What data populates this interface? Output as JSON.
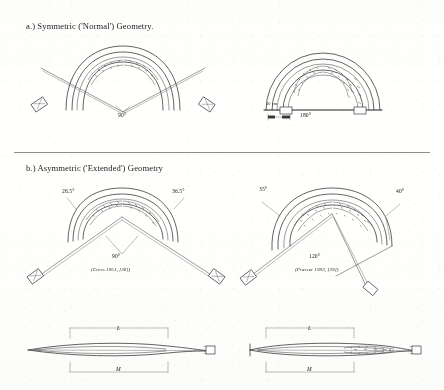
{
  "figure": {
    "sections": [
      {
        "id": "a",
        "heading": "a.)  Symmetric ('Normal') Geometry.",
        "diagrams": [
          {
            "id": "a-left",
            "angle_label": "90°",
            "scale_label": "",
            "citation": ""
          },
          {
            "id": "a-right",
            "angle_label": "180°",
            "scale_label": "10 cm",
            "citation": ""
          }
        ]
      },
      {
        "id": "b",
        "heading": "b.)  Asymmetric ('Extended') Geometry",
        "diagrams": [
          {
            "id": "b-left",
            "angle_label": "90°",
            "limb_angle_left": "26.5°",
            "limb_angle_right": "36.5°",
            "citation": "(Cross 1951, [28])"
          },
          {
            "id": "b-right",
            "angle_label": "120°",
            "limb_angle_left": "35°",
            "limb_angle_right": "40°",
            "citation": "(Prasser 1993, [29])"
          }
        ]
      }
    ],
    "profiles": [
      {
        "id": "profile-left",
        "upper_dimension": "L",
        "lower_dimension": "M"
      },
      {
        "id": "profile-right",
        "upper_dimension": "L",
        "lower_dimension": "M"
      }
    ],
    "colors": {
      "ink": "#303030",
      "paper": "#fdfdfc",
      "rule": "#8d8d8d"
    }
  }
}
